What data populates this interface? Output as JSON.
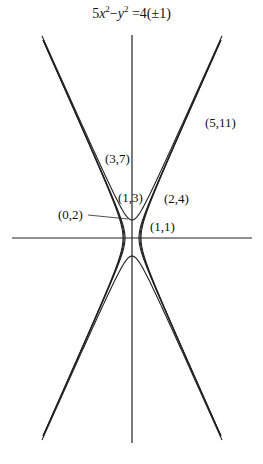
{
  "title": {
    "a": "5",
    "x": "x",
    "x_exp": "2",
    "minus": "−",
    "y": "y",
    "y_exp": "2",
    "rhs": " =4(±1)"
  },
  "equation_text": "5x^2 - y^2 = 4(±1)",
  "axes": {
    "origin_px": [
      132,
      238
    ],
    "scale_px_per_unit": 9
  },
  "points": [
    {
      "label": "(0,2)",
      "lx": 58,
      "ly": 219
    },
    {
      "label": "(1,3)",
      "lx": 118,
      "ly": 202
    },
    {
      "label": "(1,1)",
      "lx": 150,
      "ly": 231
    },
    {
      "label": "(2,4)",
      "lx": 164,
      "ly": 203
    },
    {
      "label": "(3,7)",
      "lx": 105,
      "ly": 163
    },
    {
      "label": "(5,11)",
      "lx": 205,
      "ly": 127
    }
  ],
  "curves": [
    "5x^2 - y^2 = 3",
    "5x^2 - y^2 = 4",
    "5x^2 - y^2 = 5",
    "5x^2 - y^2 = -4"
  ]
}
